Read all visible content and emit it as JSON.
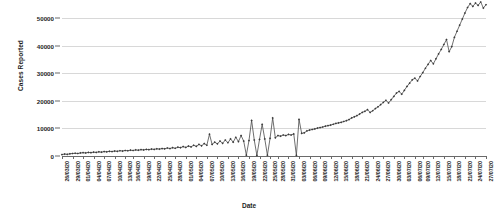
{
  "chart_data": {
    "type": "line",
    "title": "",
    "xlabel": "Date",
    "ylabel": "Cases Reported",
    "ylim": [
      0,
      50000
    ],
    "yticks": [
      0,
      10000,
      20000,
      30000,
      40000,
      50000
    ],
    "ytick_labels": [
      "0",
      "10000",
      "20000",
      "30000",
      "40000",
      "50000"
    ],
    "grid": true,
    "legend": "none",
    "line_color": "#4a4a4a",
    "marker": "diamond",
    "x_label_rotation": -90,
    "x_tick_interval_days": 3,
    "x_start": "26/03/20",
    "x_end": "27/07/20",
    "xtick_labels": [
      "26/03/20",
      "29/03/20",
      "01/04/20",
      "04/04/20",
      "07/04/20",
      "10/04/20",
      "13/04/20",
      "16/04/20",
      "19/04/20",
      "22/04/20",
      "25/04/20",
      "28/04/20",
      "01/05/20",
      "04/05/20",
      "07/05/20",
      "10/05/20",
      "13/05/20",
      "16/05/20",
      "19/05/20",
      "22/05/20",
      "25/05/20",
      "28/05/20",
      "31/05/20",
      "03/06/20",
      "06/06/20",
      "09/06/20",
      "12/06/20",
      "15/06/20",
      "18/06/20",
      "21/06/20",
      "24/06/20",
      "27/06/20",
      "30/06/20",
      "03/07/20",
      "06/07/20",
      "09/07/20",
      "12/07/20",
      "15/07/20",
      "18/07/20",
      "21/07/20",
      "24/07/20",
      "27/07/20"
    ],
    "series": [
      {
        "name": "Cases Reported",
        "values": [
          500,
          700,
          600,
          800,
          900,
          1000,
          900,
          1100,
          1200,
          1100,
          1300,
          1200,
          1400,
          1300,
          1500,
          1400,
          1600,
          1500,
          1700,
          1600,
          1800,
          1700,
          1900,
          1800,
          2000,
          1900,
          2100,
          2000,
          2200,
          2100,
          2300,
          2200,
          2400,
          2300,
          2500,
          2400,
          2600,
          2500,
          2700,
          2600,
          2900,
          2700,
          3000,
          2800,
          3200,
          3000,
          3400,
          3100,
          3600,
          3300,
          3900,
          3500,
          4200,
          3700,
          4500,
          3900,
          7900,
          4200,
          5000,
          4400,
          5400,
          4600,
          5800,
          4800,
          6200,
          5000,
          6800,
          5200,
          7400,
          5400,
          300,
          5600,
          12900,
          5800,
          200,
          6000,
          11500,
          6200,
          300,
          6400,
          13800,
          6600,
          7400,
          7200,
          7600,
          7400,
          7800,
          7600,
          8000,
          250,
          13300,
          8200,
          8400,
          9100,
          9400,
          9600,
          9800,
          10100,
          10300,
          10500,
          10800,
          11000,
          11200,
          11500,
          11800,
          12000,
          12200,
          12500,
          12800,
          13200,
          13800,
          14200,
          14600,
          15200,
          15800,
          16200,
          16800,
          15800,
          16400,
          17200,
          17800,
          18600,
          19400,
          20200,
          19200,
          20400,
          21600,
          22800,
          23400,
          22400,
          23800,
          25200,
          26400,
          27600,
          28200,
          27200,
          28800,
          30200,
          31800,
          33200,
          34600,
          33400,
          35200,
          37000,
          38600,
          40400,
          42200,
          37800,
          39600,
          43000,
          45200,
          47400,
          49600,
          51800,
          53800,
          55200,
          54200,
          55400,
          54600,
          55800,
          53600,
          54800
        ]
      }
    ]
  }
}
